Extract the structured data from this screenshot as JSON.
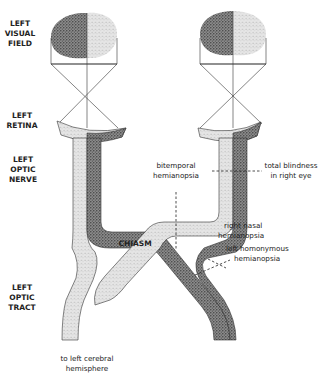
{
  "diagram": {
    "colors": {
      "dark_stipple": "#6a6a6a",
      "light_stipple": "#d2d2d2",
      "outline": "#333333",
      "background": "#ffffff"
    },
    "side_labels": {
      "visual_field": [
        "LEFT",
        "VISUAL",
        "FIELD"
      ],
      "retina": [
        "LEFT",
        "RETINA"
      ],
      "optic_nerve": [
        "LEFT",
        "OPTIC",
        "NERVE"
      ],
      "optic_tract": [
        "LEFT",
        "OPTIC",
        "TRACT"
      ]
    },
    "center_label": "CHIASM",
    "bottom_label": [
      "to left cerebral",
      "hemisphere"
    ],
    "lesions": [
      {
        "id": "bitemporal",
        "lines": [
          "bitemporal",
          "hemianopsia"
        ]
      },
      {
        "id": "total-blindness",
        "lines": [
          "total blindness",
          "in right eye"
        ]
      },
      {
        "id": "right-nasal",
        "lines": [
          "right nasal",
          "hemianopsia"
        ]
      },
      {
        "id": "left-homonymous",
        "lines": [
          "left homonymous",
          "hemianopsia"
        ]
      }
    ]
  }
}
